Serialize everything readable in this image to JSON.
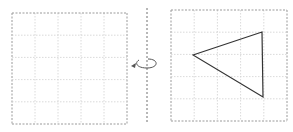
{
  "diagram": {
    "type": "rotation-about-axis",
    "left_grid": {
      "x": 12,
      "y": 13,
      "width": 115,
      "height": 111,
      "rows": 5,
      "cols": 5
    },
    "right_grid": {
      "x": 171,
      "y": 10,
      "width": 116,
      "height": 111,
      "rows": 5,
      "cols": 5
    },
    "axis": {
      "x": 147,
      "y1": 8,
      "y2": 123
    },
    "rotation_arrow": {
      "cx": 147,
      "cy": 62
    },
    "triangle": {
      "points": [
        [
          193,
          55
        ],
        [
          262,
          32
        ],
        [
          263,
          97
        ]
      ]
    },
    "colors": {
      "grid": "#b8b8b8",
      "axis": "#707070",
      "shape": "#333333",
      "arrow": "#555555"
    }
  }
}
